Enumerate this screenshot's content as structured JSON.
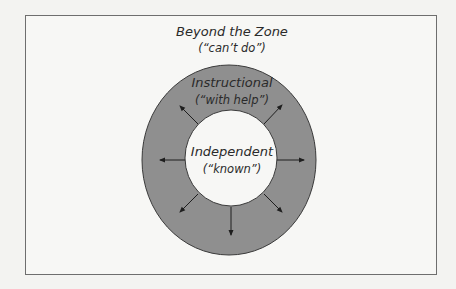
{
  "diagram": {
    "zones": [
      {
        "name": "Beyond the Zone",
        "note": "(“can’t do”)"
      },
      {
        "name": "Instructional",
        "note": "(“with help”)"
      },
      {
        "name": "Independent",
        "note": "(“known”)"
      }
    ],
    "colors": {
      "ring_fill": "#8f8f8f",
      "inner_fill": "#f7f7f5",
      "stroke": "#3a3a3a",
      "background": "#f7f7f5"
    },
    "arrows": [
      "up-left",
      "up-right",
      "left",
      "right",
      "down-left",
      "down",
      "down-right"
    ]
  }
}
